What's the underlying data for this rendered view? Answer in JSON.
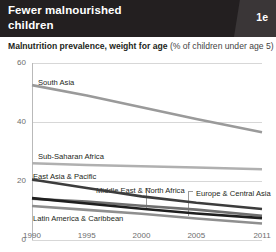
{
  "header": {
    "title": "Fewer malnourished\nchildren",
    "badge": "1e"
  },
  "subtitle": {
    "strong": "Malnutrition prevalence, weight for age",
    "light": " (% of children under age 5)"
  },
  "chart_data": {
    "type": "line",
    "title": "Fewer malnourished children",
    "subtitle": "Malnutrition prevalence, weight for age (% of children under age 5)",
    "xlabel": "",
    "ylabel": "",
    "x": [
      1990,
      1995,
      2000,
      2005,
      2011
    ],
    "xticklabels": [
      "1990",
      "1995",
      "2000",
      "2005",
      "2011"
    ],
    "yticklabels": [
      "0",
      "20",
      "40",
      "60"
    ],
    "yticks": [
      0,
      20,
      40,
      60
    ],
    "ylim": [
      0,
      60
    ],
    "xlim": [
      1990,
      2011
    ],
    "grid": "horizontal",
    "legend": "inline-labels",
    "series": [
      {
        "name": "South Asia",
        "color": "#9a9a9a",
        "values": [
          52.5,
          49.0,
          45.0,
          41.0,
          36.5
        ],
        "label_x": 38,
        "label_y": 78
      },
      {
        "name": "Sub-Saharan Africa",
        "color": "#b0b0b0",
        "values": [
          26.0,
          25.4,
          25.0,
          24.6,
          24.0
        ],
        "label_x": 38,
        "label_y": 152
      },
      {
        "name": "East Asia & Pacific",
        "color": "#3c3c3c",
        "values": [
          20.5,
          17.6,
          14.8,
          12.6,
          10.5
        ],
        "label_x": 33,
        "label_y": 172
      },
      {
        "name": "Middle East & North Africa",
        "color": "#6f6f6f",
        "values": [
          14.0,
          13.0,
          11.6,
          10.3,
          8.2
        ],
        "label_x": 96,
        "label_y": 186
      },
      {
        "name": "Europe & Central Asia",
        "color": "#1f1f1f",
        "values": [
          14.2,
          12.4,
          10.6,
          9.0,
          7.4
        ],
        "label_x": 196,
        "label_y": 189
      },
      {
        "name": "Latin America & Caribbean",
        "color": "#8f8f8f",
        "values": [
          11.5,
          10.2,
          8.9,
          7.3,
          5.6
        ],
        "label_x": 33,
        "label_y": 214
      }
    ],
    "annotations": [
      {
        "name": "leader-middle-east",
        "x": 146,
        "y_top": 188,
        "y_bottom": 210
      },
      {
        "name": "leader-europe-central-asia",
        "x": 188,
        "y_top": 191,
        "y_bottom": 216
      }
    ]
  }
}
